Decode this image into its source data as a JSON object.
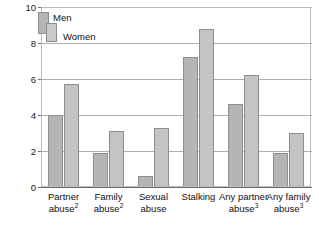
{
  "legend": {
    "men_label": "Men",
    "women_label": "Women",
    "men_color": "#b5b5b5",
    "women_color": "#c4c4c4",
    "position": "top-left-inside"
  },
  "axis": {
    "y_ticks": [
      "0",
      "2",
      "4",
      "6",
      "8",
      "10"
    ],
    "y_tick_values": [
      0,
      2,
      4,
      6,
      8,
      10
    ]
  },
  "categories": [
    {
      "line1": "Partner",
      "line2": "abuse",
      "sup": "2"
    },
    {
      "line1": "Family",
      "line2": "abuse",
      "sup": "2"
    },
    {
      "line1": "Sexual",
      "line2": "abuse",
      "sup": ""
    },
    {
      "line1": "Stalking",
      "line2": "",
      "sup": ""
    },
    {
      "line1": "Any partner",
      "line2": "abuse",
      "sup": "3"
    },
    {
      "line1": "Any family",
      "line2": "abuse",
      "sup": "3"
    }
  ],
  "chart_data": {
    "type": "bar",
    "title": "",
    "subtitle": "",
    "xlabel": "",
    "ylabel": "",
    "ylim": [
      0,
      10
    ],
    "grid": true,
    "legend_position": "top-left",
    "categories": [
      "Partner abuse2",
      "Family abuse2",
      "Sexual abuse",
      "Stalking",
      "Any partner abuse3",
      "Any family abuse3"
    ],
    "series": [
      {
        "name": "Men",
        "color": "#b5b5b5",
        "values": [
          4.0,
          1.9,
          0.6,
          7.2,
          4.6,
          1.9
        ]
      },
      {
        "name": "Women",
        "color": "#c4c4c4",
        "values": [
          5.7,
          3.1,
          3.3,
          8.8,
          6.2,
          3.0
        ]
      }
    ],
    "tick_labels": [
      "0",
      "2",
      "4",
      "6",
      "8",
      "10"
    ]
  }
}
